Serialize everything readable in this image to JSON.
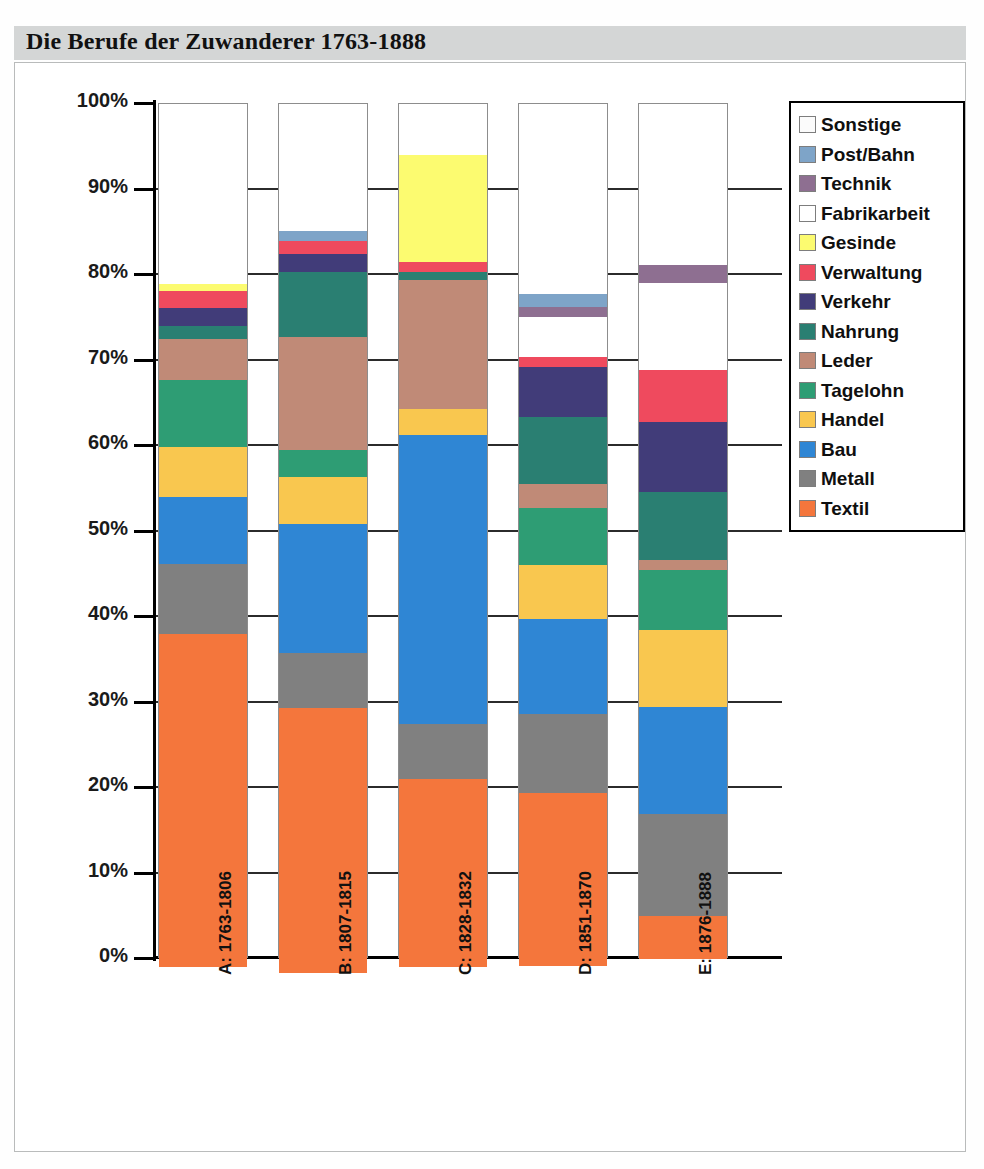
{
  "title": "Die Berufe der Zuwanderer 1763-1888",
  "legend": {
    "position": "right",
    "items": [
      {
        "label": "Sonstige",
        "color": "#fbfbfb"
      },
      {
        "label": "Post/Bahn",
        "color": "#7ea4c8"
      },
      {
        "label": "Technik",
        "color": "#8e6f91"
      },
      {
        "label": "Fabrikarbeit",
        "color": "#ffffff"
      },
      {
        "label": "Gesinde",
        "color": "#fcfb70"
      },
      {
        "label": "Verwaltung",
        "color": "#ef4a5e"
      },
      {
        "label": "Verkehr",
        "color": "#413c79"
      },
      {
        "label": "Nahrung",
        "color": "#2a7f72"
      },
      {
        "label": "Leder",
        "color": "#c08a77"
      },
      {
        "label": "Tagelohn",
        "color": "#2e9d74"
      },
      {
        "label": "Handel",
        "color": "#f9c74f"
      },
      {
        "label": "Bau",
        "color": "#2f86d4"
      },
      {
        "label": "Metall",
        "color": "#808080"
      },
      {
        "label": "Textil",
        "color": "#f4763c"
      }
    ]
  },
  "axis": {
    "y_ticks": [
      "0%",
      "10%",
      "20%",
      "30%",
      "40%",
      "50%",
      "60%",
      "70%",
      "80%",
      "90%",
      "100%"
    ],
    "y_min": 0,
    "y_max": 100
  },
  "categories": [
    "A: 1763-1806",
    "B: 1807-1815",
    "C: 1828-1832",
    "D: 1851-1870",
    "E: 1876-1888"
  ],
  "chart_data": {
    "type": "bar",
    "subtype": "stacked-100-percent",
    "title": "Die Berufe der Zuwanderer 1763-1888",
    "xlabel": "",
    "ylabel": "",
    "ylim": [
      0,
      100
    ],
    "grid": true,
    "legend_position": "right",
    "categories": [
      "A: 1763-1806",
      "B: 1807-1815",
      "C: 1828-1832",
      "D: 1851-1870",
      "E: 1876-1888"
    ],
    "series": [
      {
        "name": "Textil",
        "color": "#f4763c",
        "values": [
          39.0,
          31.0,
          22.0,
          20.2,
          5.0
        ]
      },
      {
        "name": "Metall",
        "color": "#808080",
        "values": [
          8.2,
          6.4,
          6.4,
          9.2,
          12.0
        ]
      },
      {
        "name": "Bau",
        "color": "#2f86d4",
        "values": [
          7.8,
          15.1,
          33.8,
          11.2,
          12.5
        ]
      },
      {
        "name": "Handel",
        "color": "#f9c74f",
        "values": [
          5.9,
          5.5,
          3.0,
          6.3,
          9.0
        ]
      },
      {
        "name": "Tagelohn",
        "color": "#2e9d74",
        "values": [
          7.8,
          3.1,
          0.0,
          6.6,
          7.0
        ]
      },
      {
        "name": "Leder",
        "color": "#c08a77",
        "values": [
          4.8,
          13.3,
          15.1,
          2.9,
          1.2
        ]
      },
      {
        "name": "Nahrung",
        "color": "#2a7f72",
        "values": [
          1.5,
          7.5,
          0.9,
          7.8,
          7.9
        ]
      },
      {
        "name": "Verkehr",
        "color": "#413c79",
        "values": [
          2.1,
          2.1,
          0.0,
          5.8,
          8.2
        ]
      },
      {
        "name": "Verwaltung",
        "color": "#ef4a5e",
        "values": [
          2.0,
          1.6,
          1.2,
          1.2,
          6.1
        ]
      },
      {
        "name": "Gesinde",
        "color": "#fcfb70",
        "values": [
          0.9,
          0.0,
          12.5,
          0.0,
          0.0
        ]
      },
      {
        "name": "Fabrikarbeit",
        "color": "#ffffff",
        "values": [
          0.0,
          0.0,
          0.0,
          4.7,
          10.2
        ]
      },
      {
        "name": "Technik",
        "color": "#8e6f91",
        "values": [
          0.0,
          0.0,
          0.0,
          1.2,
          2.1
        ]
      },
      {
        "name": "Post/Bahn",
        "color": "#7ea4c8",
        "values": [
          0.0,
          1.2,
          0.0,
          1.5,
          0.0
        ]
      },
      {
        "name": "Sonstige",
        "color": "#fbfbfb",
        "values": [
          21.0,
          14.8,
          6.0,
          22.2,
          18.8
        ]
      }
    ],
    "totals": [
      100,
      100,
      100,
      100,
      100
    ]
  }
}
